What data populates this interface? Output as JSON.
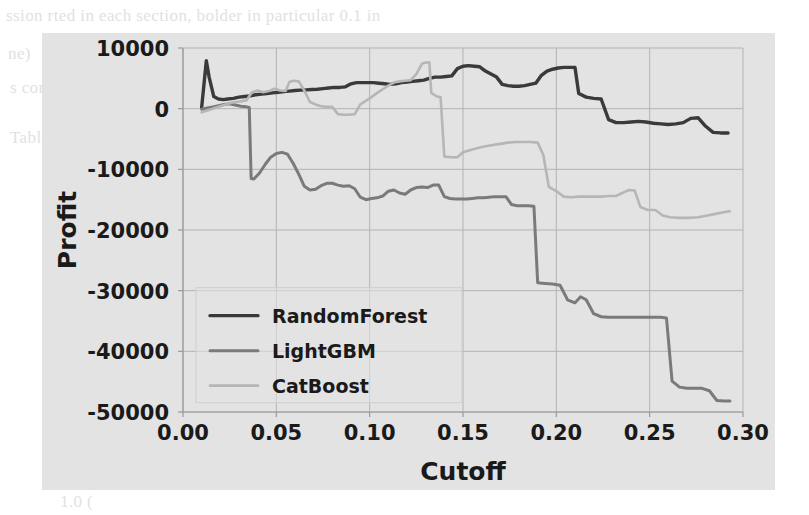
{
  "figure": {
    "background_color": "#e3e3e3",
    "page_color": "#ffffff"
  },
  "page_bleed": {
    "lines": [
      "ssion   rted   in each  section,   bolder  in particular  0.1 in",
      "ne)",
      "s confidence interval estimated from bootstrap resampling",
      "Table 2. Comparison of Models for Cutoff Selected from Validation",
      "Model",
      "Gradient Boosting",
      "CatBoost",
      "Random Forest",
      "(0.00) ",
      "1.0 ("
    ]
  },
  "chart_data": {
    "type": "line",
    "title": "",
    "xlabel": "Cutoff",
    "ylabel": "Profit",
    "xlim": [
      0.0,
      0.3
    ],
    "ylim": [
      -50000,
      10000
    ],
    "xticks": [
      0.0,
      0.05,
      0.1,
      0.15,
      0.2,
      0.25,
      0.3
    ],
    "xtick_labels": [
      "0.00",
      "0.05",
      "0.10",
      "0.15",
      "0.20",
      "0.25",
      "0.30"
    ],
    "yticks": [
      10000,
      0,
      -10000,
      -20000,
      -30000,
      -40000,
      -50000
    ],
    "ytick_labels": [
      "10000",
      "0",
      "-10000",
      "-20000",
      "-30000",
      "-40000",
      "-50000"
    ],
    "grid": true,
    "legend_position": "lower left",
    "series": [
      {
        "name": "RandomForest",
        "color": "#3a3a3a",
        "width": 3.4,
        "points": [
          [
            0.01,
            200
          ],
          [
            0.0125,
            7900
          ],
          [
            0.014,
            5200
          ],
          [
            0.0165,
            2000
          ],
          [
            0.019,
            1600
          ],
          [
            0.0215,
            1500
          ],
          [
            0.024,
            1600
          ],
          [
            0.027,
            1700
          ],
          [
            0.03,
            1900
          ],
          [
            0.033,
            2000
          ],
          [
            0.036,
            2100
          ],
          [
            0.039,
            2300
          ],
          [
            0.042,
            2400
          ],
          [
            0.045,
            2500
          ],
          [
            0.048,
            2600
          ],
          [
            0.051,
            2700
          ],
          [
            0.054,
            2800
          ],
          [
            0.057,
            2900
          ],
          [
            0.06,
            3000
          ],
          [
            0.063,
            3050
          ],
          [
            0.066,
            3100
          ],
          [
            0.069,
            3150
          ],
          [
            0.072,
            3200
          ],
          [
            0.075,
            3300
          ],
          [
            0.078,
            3400
          ],
          [
            0.081,
            3500
          ],
          [
            0.084,
            3500
          ],
          [
            0.087,
            3600
          ],
          [
            0.09,
            4100
          ],
          [
            0.093,
            4300
          ],
          [
            0.096,
            4300
          ],
          [
            0.099,
            4300
          ],
          [
            0.102,
            4300
          ],
          [
            0.105,
            4200
          ],
          [
            0.108,
            4100
          ],
          [
            0.111,
            4000
          ],
          [
            0.114,
            4100
          ],
          [
            0.117,
            4300
          ],
          [
            0.12,
            4400
          ],
          [
            0.123,
            4500
          ],
          [
            0.126,
            4600
          ],
          [
            0.129,
            4700
          ],
          [
            0.132,
            5000
          ],
          [
            0.135,
            5200
          ],
          [
            0.138,
            5200
          ],
          [
            0.141,
            5300
          ],
          [
            0.144,
            5400
          ],
          [
            0.147,
            6600
          ],
          [
            0.15,
            7000
          ],
          [
            0.153,
            7100
          ],
          [
            0.156,
            7000
          ],
          [
            0.159,
            6900
          ],
          [
            0.162,
            6200
          ],
          [
            0.165,
            5700
          ],
          [
            0.168,
            5200
          ],
          [
            0.171,
            4000
          ],
          [
            0.174,
            3800
          ],
          [
            0.177,
            3700
          ],
          [
            0.18,
            3700
          ],
          [
            0.183,
            3800
          ],
          [
            0.186,
            4000
          ],
          [
            0.189,
            4200
          ],
          [
            0.192,
            5500
          ],
          [
            0.195,
            6200
          ],
          [
            0.198,
            6500
          ],
          [
            0.201,
            6700
          ],
          [
            0.204,
            6800
          ],
          [
            0.207,
            6800
          ],
          [
            0.21,
            6800
          ],
          [
            0.212,
            2500
          ],
          [
            0.216,
            1900
          ],
          [
            0.22,
            1700
          ],
          [
            0.224,
            1600
          ],
          [
            0.228,
            -1800
          ],
          [
            0.232,
            -2300
          ],
          [
            0.236,
            -2300
          ],
          [
            0.24,
            -2200
          ],
          [
            0.244,
            -2100
          ],
          [
            0.248,
            -2200
          ],
          [
            0.252,
            -2400
          ],
          [
            0.256,
            -2500
          ],
          [
            0.26,
            -2600
          ],
          [
            0.264,
            -2500
          ],
          [
            0.268,
            -2300
          ],
          [
            0.272,
            -1600
          ],
          [
            0.276,
            -1500
          ],
          [
            0.28,
            -2900
          ],
          [
            0.284,
            -3900
          ],
          [
            0.288,
            -4000
          ],
          [
            0.292,
            -4000
          ]
        ]
      },
      {
        "name": "LightGBM",
        "color": "#7a7a7a",
        "width": 3.0,
        "points": [
          [
            0.01,
            -100
          ],
          [
            0.013,
            100
          ],
          [
            0.016,
            300
          ],
          [
            0.019,
            500
          ],
          [
            0.022,
            700
          ],
          [
            0.025,
            800
          ],
          [
            0.028,
            600
          ],
          [
            0.031,
            400
          ],
          [
            0.034,
            300
          ],
          [
            0.0355,
            200
          ],
          [
            0.0365,
            -11500
          ],
          [
            0.038,
            -11600
          ],
          [
            0.041,
            -10600
          ],
          [
            0.044,
            -9200
          ],
          [
            0.047,
            -8000
          ],
          [
            0.05,
            -7400
          ],
          [
            0.053,
            -7200
          ],
          [
            0.056,
            -7500
          ],
          [
            0.059,
            -9000
          ],
          [
            0.062,
            -10800
          ],
          [
            0.065,
            -12800
          ],
          [
            0.068,
            -13400
          ],
          [
            0.071,
            -13300
          ],
          [
            0.074,
            -12700
          ],
          [
            0.077,
            -12300
          ],
          [
            0.08,
            -12300
          ],
          [
            0.083,
            -12600
          ],
          [
            0.086,
            -12800
          ],
          [
            0.089,
            -12700
          ],
          [
            0.092,
            -13200
          ],
          [
            0.095,
            -14600
          ],
          [
            0.098,
            -15000
          ],
          [
            0.101,
            -14800
          ],
          [
            0.104,
            -14700
          ],
          [
            0.107,
            -14400
          ],
          [
            0.11,
            -13600
          ],
          [
            0.113,
            -13400
          ],
          [
            0.116,
            -13900
          ],
          [
            0.119,
            -14100
          ],
          [
            0.122,
            -13400
          ],
          [
            0.125,
            -13000
          ],
          [
            0.128,
            -12900
          ],
          [
            0.131,
            -13000
          ],
          [
            0.134,
            -12600
          ],
          [
            0.137,
            -12600
          ],
          [
            0.14,
            -14500
          ],
          [
            0.143,
            -14800
          ],
          [
            0.146,
            -14900
          ],
          [
            0.149,
            -14900
          ],
          [
            0.152,
            -14900
          ],
          [
            0.155,
            -14800
          ],
          [
            0.158,
            -14700
          ],
          [
            0.161,
            -14700
          ],
          [
            0.164,
            -14600
          ],
          [
            0.167,
            -14500
          ],
          [
            0.17,
            -14500
          ],
          [
            0.173,
            -14500
          ],
          [
            0.176,
            -15800
          ],
          [
            0.179,
            -16000
          ],
          [
            0.182,
            -16000
          ],
          [
            0.185,
            -16000
          ],
          [
            0.188,
            -16100
          ],
          [
            0.19,
            -28700
          ],
          [
            0.194,
            -28800
          ],
          [
            0.198,
            -28900
          ],
          [
            0.202,
            -29100
          ],
          [
            0.206,
            -31500
          ],
          [
            0.21,
            -32000
          ],
          [
            0.213,
            -31000
          ],
          [
            0.216,
            -31500
          ],
          [
            0.22,
            -33800
          ],
          [
            0.224,
            -34300
          ],
          [
            0.228,
            -34400
          ],
          [
            0.234,
            -34400
          ],
          [
            0.24,
            -34400
          ],
          [
            0.246,
            -34400
          ],
          [
            0.252,
            -34400
          ],
          [
            0.256,
            -34400
          ],
          [
            0.259,
            -34500
          ],
          [
            0.262,
            -44900
          ],
          [
            0.266,
            -45900
          ],
          [
            0.27,
            -46100
          ],
          [
            0.274,
            -46100
          ],
          [
            0.278,
            -46100
          ],
          [
            0.282,
            -46500
          ],
          [
            0.286,
            -48100
          ],
          [
            0.29,
            -48200
          ],
          [
            0.293,
            -48200
          ]
        ]
      },
      {
        "name": "CatBoost",
        "color": "#b6b6b6",
        "width": 2.6,
        "points": [
          [
            0.01,
            -600
          ],
          [
            0.013,
            -300
          ],
          [
            0.016,
            0
          ],
          [
            0.019,
            300
          ],
          [
            0.022,
            600
          ],
          [
            0.025,
            900
          ],
          [
            0.028,
            1100
          ],
          [
            0.031,
            1200
          ],
          [
            0.034,
            1400
          ],
          [
            0.037,
            2700
          ],
          [
            0.04,
            3000
          ],
          [
            0.043,
            2700
          ],
          [
            0.046,
            2900
          ],
          [
            0.049,
            3300
          ],
          [
            0.052,
            3000
          ],
          [
            0.055,
            2900
          ],
          [
            0.057,
            4400
          ],
          [
            0.059,
            4600
          ],
          [
            0.062,
            4500
          ],
          [
            0.065,
            3000
          ],
          [
            0.068,
            1100
          ],
          [
            0.071,
            700
          ],
          [
            0.074,
            400
          ],
          [
            0.077,
            300
          ],
          [
            0.08,
            300
          ],
          [
            0.083,
            -900
          ],
          [
            0.086,
            -1000
          ],
          [
            0.089,
            -1000
          ],
          [
            0.092,
            -900
          ],
          [
            0.095,
            700
          ],
          [
            0.098,
            1300
          ],
          [
            0.101,
            1900
          ],
          [
            0.104,
            2600
          ],
          [
            0.107,
            3200
          ],
          [
            0.11,
            3800
          ],
          [
            0.113,
            4300
          ],
          [
            0.116,
            4500
          ],
          [
            0.119,
            4600
          ],
          [
            0.122,
            4700
          ],
          [
            0.125,
            5700
          ],
          [
            0.128,
            7400
          ],
          [
            0.13,
            7600
          ],
          [
            0.132,
            7600
          ],
          [
            0.133,
            2600
          ],
          [
            0.136,
            2000
          ],
          [
            0.138,
            1900
          ],
          [
            0.14,
            -7900
          ],
          [
            0.144,
            -8000
          ],
          [
            0.147,
            -8000
          ],
          [
            0.15,
            -7200
          ],
          [
            0.154,
            -6800
          ],
          [
            0.158,
            -6500
          ],
          [
            0.162,
            -6200
          ],
          [
            0.166,
            -6000
          ],
          [
            0.17,
            -5800
          ],
          [
            0.174,
            -5600
          ],
          [
            0.178,
            -5500
          ],
          [
            0.182,
            -5500
          ],
          [
            0.186,
            -5500
          ],
          [
            0.19,
            -5600
          ],
          [
            0.193,
            -7600
          ],
          [
            0.196,
            -12900
          ],
          [
            0.2,
            -13600
          ],
          [
            0.204,
            -14500
          ],
          [
            0.208,
            -14600
          ],
          [
            0.212,
            -14500
          ],
          [
            0.216,
            -14500
          ],
          [
            0.22,
            -14500
          ],
          [
            0.224,
            -14500
          ],
          [
            0.228,
            -14400
          ],
          [
            0.232,
            -14400
          ],
          [
            0.236,
            -13800
          ],
          [
            0.239,
            -13400
          ],
          [
            0.242,
            -13500
          ],
          [
            0.245,
            -16200
          ],
          [
            0.249,
            -16700
          ],
          [
            0.253,
            -16700
          ],
          [
            0.257,
            -17600
          ],
          [
            0.261,
            -17900
          ],
          [
            0.266,
            -18000
          ],
          [
            0.271,
            -18000
          ],
          [
            0.276,
            -17900
          ],
          [
            0.281,
            -17600
          ],
          [
            0.286,
            -17300
          ],
          [
            0.291,
            -17000
          ],
          [
            0.293,
            -16900
          ]
        ]
      }
    ]
  }
}
